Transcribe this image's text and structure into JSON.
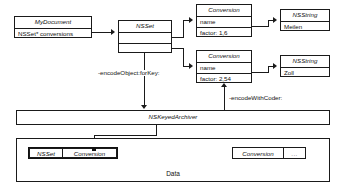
{
  "diagram": {
    "title_label": "Data",
    "objects": {
      "mydocument": {
        "class_name": "MyDocument",
        "field": "NSSet* conversions"
      },
      "nsset": {
        "class_name": "NSSet",
        "slot1": "",
        "slot2": ""
      },
      "conversion1": {
        "class_name": "Conversion",
        "name_field": "name",
        "factor_field": "factor: 1,6"
      },
      "conversion2": {
        "class_name": "Conversion",
        "name_field": "name",
        "factor_field": "factor: 2,54"
      },
      "nsstring1": {
        "class_name": "NSString",
        "value": "Meilen"
      },
      "nsstring2": {
        "class_name": "NSString",
        "value": "Zoll"
      },
      "archiver": {
        "class_name": "NSKeyedArchiver"
      }
    },
    "edge_labels": {
      "encode_object_for_key": "-encodeObject:forKey:",
      "encode_with_coder": "-encodeWithCoder:"
    },
    "data_cells": {
      "left_group": [
        "NSSet",
        "Conversion"
      ],
      "right_group": [
        "Conversion",
        "..."
      ]
    }
  },
  "colors": {
    "stroke": "#1a1a1a",
    "text": "#111111",
    "background": "#ffffff"
  }
}
